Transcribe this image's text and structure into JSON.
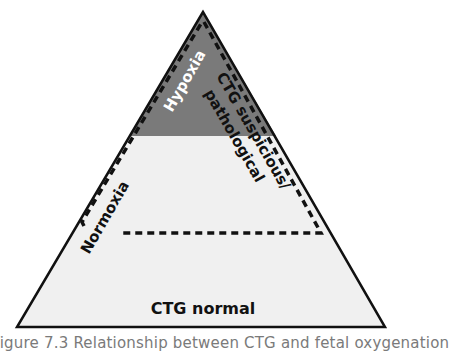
{
  "diagram": {
    "type": "pyramid",
    "colors": {
      "outline": "#111111",
      "hypoxia_fill": "#7a7a7a",
      "base_fill": "#f0f0f0",
      "dashed": "#111111"
    },
    "labels": {
      "hypoxia": "Hypoxia",
      "ctg_suspicious_line1": "CTG suspicious/",
      "ctg_suspicious_line2": "pathological",
      "normoxia": "Normoxia",
      "ctg_normal": "CTG normal"
    }
  },
  "caption": "Figure 7.3 Relationship between CTG and fetal oxygenation"
}
